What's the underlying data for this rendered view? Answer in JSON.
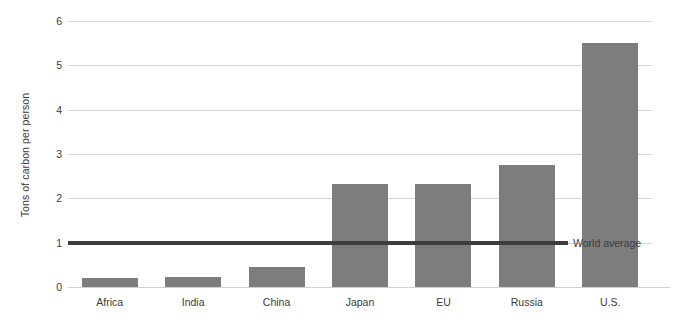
{
  "chart_data": {
    "type": "bar",
    "title": "",
    "xlabel": "",
    "ylabel": "Tons of carbon per person",
    "categories": [
      "Africa",
      "India",
      "China",
      "Japan",
      "EU",
      "Russia",
      "U.S."
    ],
    "values": [
      0.2,
      0.22,
      0.45,
      2.32,
      2.32,
      2.75,
      5.5
    ],
    "ylim": [
      0,
      6
    ],
    "yticks": [
      0,
      1,
      2,
      3,
      4,
      5,
      6
    ],
    "ytick_labels": [
      "0",
      "1",
      "2",
      "3",
      "4",
      "5",
      "6"
    ],
    "grid": true,
    "legend": false,
    "bar_color": "#7d7d7d",
    "gridline_color": "#d6d6d6",
    "annotations": [
      {
        "name": "world-average",
        "label": "World average",
        "value": 1.0,
        "type": "horizontal-reference-line",
        "color": "#3d3d3d"
      }
    ]
  }
}
